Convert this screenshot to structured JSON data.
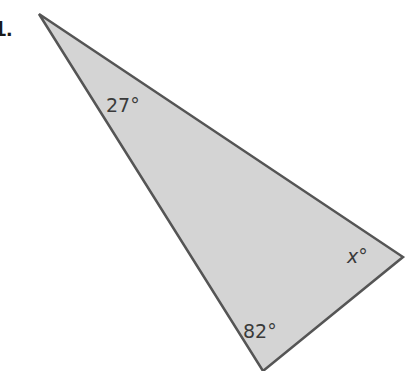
{
  "problem": {
    "number_label": "1."
  },
  "triangle": {
    "fill_color": "#d4d4d4",
    "stroke_color": "#555555",
    "vertices": {
      "top": [
        39,
        14
      ],
      "right": [
        403,
        257
      ],
      "bottom": [
        263,
        371
      ]
    },
    "angles": {
      "top": "27°",
      "right": "x°",
      "bottom": "82°"
    }
  }
}
